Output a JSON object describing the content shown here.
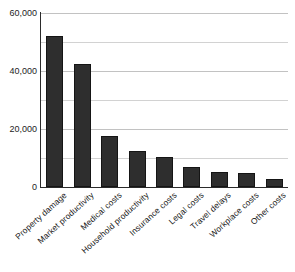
{
  "chart_data": {
    "type": "bar",
    "title": "",
    "title_visible": false,
    "xlabel": "",
    "ylabel": "",
    "categories": [
      "Property damage",
      "Market productivity",
      "Medical costs",
      "Household productivity",
      "Insurance costs",
      "Legal costs",
      "Travel delays",
      "Workplace costs",
      "Other costs"
    ],
    "values": [
      52000,
      42500,
      17500,
      12500,
      10500,
      6800,
      5300,
      4800,
      2800
    ],
    "ylim": [
      0,
      60000
    ],
    "ytick_labels": [
      "0",
      "20,000",
      "40,000",
      "60,000"
    ],
    "ytick_values": [
      0,
      20000,
      40000,
      60000
    ],
    "gridline_values": [
      10000,
      20000,
      30000,
      40000,
      50000,
      60000
    ],
    "grid": true,
    "legend": false,
    "legend_position": "none",
    "bar_color": "#2e2e2e",
    "bar_edge_color": "#151515",
    "grid_color": "#d2d2d2",
    "axis_color": "#2b2b2b",
    "background": "#ffffff",
    "tick_label_rotation": -42
  },
  "axis": {
    "y_labels": [
      {
        "text": "60,000",
        "value": 60000
      },
      {
        "text": "40,000",
        "value": 40000
      },
      {
        "text": "20,000",
        "value": 20000
      },
      {
        "text": "0",
        "value": 0
      }
    ]
  }
}
